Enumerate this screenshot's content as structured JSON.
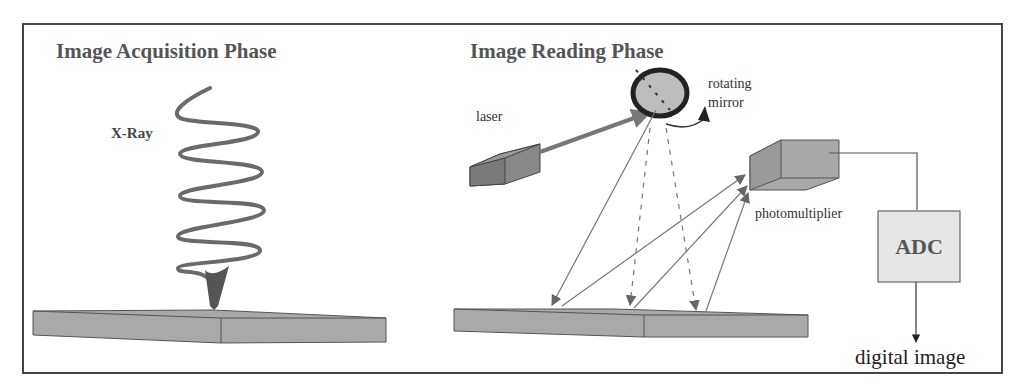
{
  "panels": {
    "acquisition": {
      "title": "Image Acquisition Phase",
      "xray_label": "X-Ray"
    },
    "reading": {
      "title": "Image Reading Phase",
      "laser_label": "laser",
      "mirror_label_line1": "rotating",
      "mirror_label_line2": "mirror",
      "photomultiplier_label": "photomultiplier",
      "adc_label": "ADC",
      "output_label": "digital image"
    }
  },
  "colors": {
    "frame": "#444444",
    "plate_fill": "#a9a9a9",
    "beam": "#666666",
    "adc_fill": "#e6e6e6",
    "mirror_fill": "#bdbdbd"
  }
}
